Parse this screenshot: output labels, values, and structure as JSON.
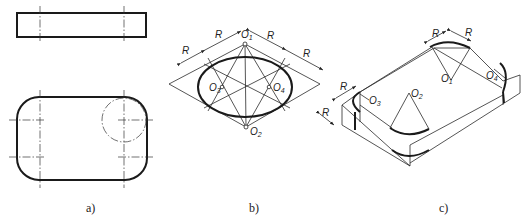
{
  "figure": {
    "panels": [
      {
        "id": "a",
        "label": "a)",
        "description": "Orthographic views: top rectangle (side view) and rounded rectangle plan view with center lines and a corner circle"
      },
      {
        "id": "b",
        "label": "b)",
        "description": "Four-center approximate ellipse construction inside a rhombus"
      },
      {
        "id": "c",
        "label": "c)",
        "description": "Isometric view of a plate with rounded corners constructed by arcs"
      }
    ],
    "annotations": {
      "radius": "R",
      "centers": [
        "O1",
        "O2",
        "O3",
        "O4"
      ],
      "center_prefix": "O",
      "center_subs": [
        "1",
        "2",
        "3",
        "4"
      ]
    }
  }
}
